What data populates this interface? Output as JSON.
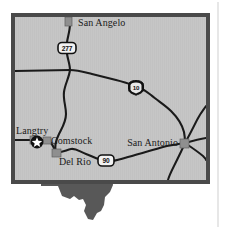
{
  "figure": {
    "kind": "locator-map",
    "region": "Southwest Texas",
    "background_color": "#ffffff",
    "map_fill_color": "#c6c6c6",
    "map_border_color": "#4a4a4a",
    "road_color": "#1a1a1a",
    "city_marker_color": "#8f8f8f",
    "state_silhouette_color": "#585858",
    "label_color": "#1a1a1a",
    "rule_color": "#cfcfcf"
  },
  "map_frame": {
    "x": 11,
    "y": 13,
    "width": 199,
    "height": 171,
    "border_width": 4
  },
  "cities": [
    {
      "name": "San Angelo",
      "label": "San Angelo",
      "marker": "square",
      "marker_x": 69,
      "marker_y": 21,
      "label_x": 78,
      "label_y": 25,
      "anchor": "start"
    },
    {
      "name": "Langtry",
      "label": "Langtry",
      "marker": "star-in-circle",
      "marker_x": 37,
      "marker_y": 142,
      "label_x": 17,
      "label_y": 134,
      "anchor": "start"
    },
    {
      "name": "Comstock",
      "label": "Comstock",
      "marker": "square",
      "marker_x": 46,
      "marker_y": 140,
      "label_x": 51,
      "label_y": 143,
      "anchor": "start"
    },
    {
      "name": "Del Rio",
      "label": "Del Rio",
      "marker": "square",
      "marker_x": 56,
      "marker_y": 153,
      "label_x": 59,
      "label_y": 163,
      "anchor": "start"
    },
    {
      "name": "San Antonio",
      "label": "San Antonio",
      "marker": "square",
      "marker_x": 184,
      "marker_y": 143,
      "label_x": 180,
      "label_y": 144,
      "anchor": "end"
    }
  ],
  "highways": [
    {
      "name": "US 277",
      "number": "277",
      "shield_type": "us-route",
      "shield_x": 67,
      "shield_y": 48,
      "shield_width": 18,
      "shield_height": 11
    },
    {
      "name": "Interstate 10",
      "number": "10",
      "shield_type": "interstate",
      "shield_x": 136,
      "shield_y": 87,
      "shield_width": 15,
      "shield_height": 13
    },
    {
      "name": "US 90",
      "number": "90",
      "shield_type": "us-route",
      "shield_x": 106,
      "shield_y": 160,
      "shield_width": 16,
      "shield_height": 11
    }
  ],
  "roads": [
    {
      "id": "us277-north",
      "label": "US 277 north of San Angelo"
    },
    {
      "id": "us277-south",
      "label": "US 277 toward Del Rio"
    },
    {
      "id": "east-west-north",
      "label": "east-west road across north"
    },
    {
      "id": "i10",
      "label": "Interstate 10 to San Antonio"
    },
    {
      "id": "us90",
      "label": "US 90 Del Rio to San Antonio"
    },
    {
      "id": "langtry-spur",
      "label": "Langtry connector road"
    },
    {
      "id": "sa-radial-ne",
      "label": "San Antonio northeast radial"
    },
    {
      "id": "sa-radial-e",
      "label": "San Antonio east radial"
    },
    {
      "id": "sa-radial-se",
      "label": "San Antonio southeast radial"
    },
    {
      "id": "sa-radial-s",
      "label": "San Antonio south radial"
    }
  ],
  "inset": {
    "name": "texas-state-silhouette",
    "label": "Texas",
    "fill": "#585858"
  },
  "page_rule": {
    "name": "page-margin-rule",
    "x": 218
  }
}
